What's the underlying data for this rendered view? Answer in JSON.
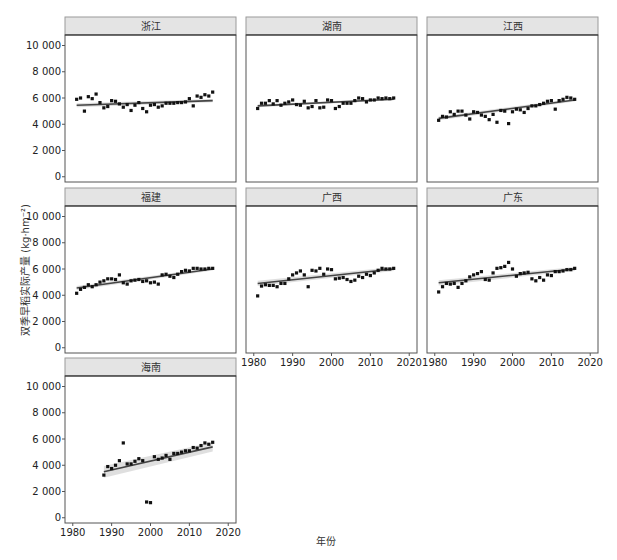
{
  "chart_data": {
    "type": "scatter",
    "layout": "facet_wrap",
    "facet_columns": 3,
    "xlabel": "年份",
    "ylabel": "双季早稻实际产量 (kg·hm⁻²)",
    "xlim": [
      1978,
      2022
    ],
    "ylim": [
      -400,
      10800
    ],
    "x_ticks": [
      1980,
      1990,
      2000,
      2010,
      2020
    ],
    "y_ticks": [
      0,
      2000,
      4000,
      6000,
      8000,
      10000
    ],
    "y_tick_labels": [
      "0",
      "2 000",
      "4 000",
      "6 000",
      "8 000",
      "10 000"
    ],
    "grid": false,
    "legend": "none",
    "colors": {
      "points": "#111111",
      "trend": "#444444",
      "band": "#d9d9d9",
      "strip": "#e4e4e4",
      "frame": "#555555"
    },
    "panels": [
      {
        "name": "浙江",
        "x": [
          1981,
          1982,
          1983,
          1984,
          1985,
          1986,
          1987,
          1988,
          1989,
          1990,
          1991,
          1992,
          1993,
          1994,
          1995,
          1996,
          1997,
          1998,
          1999,
          2000,
          2001,
          2002,
          2003,
          2004,
          2005,
          2006,
          2007,
          2008,
          2009,
          2010,
          2011,
          2012,
          2013,
          2014,
          2015,
          2016
        ],
        "y": [
          5900,
          6000,
          5000,
          6100,
          5950,
          6300,
          5650,
          5250,
          5350,
          5800,
          5750,
          5550,
          5300,
          5500,
          5050,
          5450,
          5650,
          5200,
          4950,
          5450,
          5500,
          5300,
          5400,
          5600,
          5600,
          5600,
          5650,
          5650,
          5700,
          5950,
          5400,
          6150,
          6050,
          6250,
          6150,
          6450
        ],
        "trend": {
          "x0": 1981,
          "y0": 5450,
          "x1": 2016,
          "y1": 5800,
          "band": 150
        }
      },
      {
        "name": "湖南",
        "x": [
          1981,
          1982,
          1983,
          1984,
          1985,
          1986,
          1987,
          1988,
          1989,
          1990,
          1991,
          1992,
          1993,
          1994,
          1995,
          1996,
          1997,
          1998,
          1999,
          2000,
          2001,
          2002,
          2003,
          2004,
          2005,
          2006,
          2007,
          2008,
          2009,
          2010,
          2011,
          2012,
          2013,
          2014,
          2015,
          2016
        ],
        "y": [
          5200,
          5600,
          5600,
          5800,
          5550,
          5800,
          5450,
          5600,
          5700,
          5850,
          5500,
          5450,
          5750,
          5250,
          5350,
          5800,
          5250,
          5300,
          5850,
          5800,
          5200,
          5350,
          5600,
          5600,
          5600,
          5800,
          6000,
          5950,
          5700,
          5850,
          5850,
          6000,
          5950,
          6000,
          5950,
          6000
        ],
        "trend": {
          "x0": 1981,
          "y0": 5400,
          "x1": 2016,
          "y1": 5900,
          "band": 100
        }
      },
      {
        "name": "江西",
        "x": [
          1981,
          1982,
          1983,
          1984,
          1985,
          1986,
          1987,
          1988,
          1989,
          1990,
          1991,
          1992,
          1993,
          1994,
          1995,
          1996,
          1997,
          1998,
          1999,
          2000,
          2001,
          2002,
          2003,
          2004,
          2005,
          2006,
          2007,
          2008,
          2009,
          2010,
          2011,
          2012,
          2013,
          2014,
          2015,
          2016
        ],
        "y": [
          4300,
          4600,
          4550,
          4950,
          4750,
          5000,
          5000,
          4700,
          4400,
          4950,
          4900,
          4700,
          4600,
          4350,
          4750,
          4150,
          5050,
          5000,
          4050,
          4950,
          5150,
          5100,
          4900,
          5200,
          5400,
          5400,
          5500,
          5600,
          5750,
          5800,
          5150,
          5800,
          5900,
          6050,
          6000,
          5900
        ],
        "trend": {
          "x0": 1981,
          "y0": 4450,
          "x1": 2016,
          "y1": 5850,
          "band": 150
        }
      },
      {
        "name": "福建",
        "x": [
          1981,
          1982,
          1983,
          1984,
          1985,
          1986,
          1987,
          1988,
          1989,
          1990,
          1991,
          1992,
          1993,
          1994,
          1995,
          1996,
          1997,
          1998,
          1999,
          2000,
          2001,
          2002,
          2003,
          2004,
          2005,
          2006,
          2007,
          2008,
          2009,
          2010,
          2011,
          2012,
          2013,
          2014,
          2015,
          2016
        ],
        "y": [
          4150,
          4450,
          4600,
          4800,
          4650,
          4800,
          5000,
          5100,
          5250,
          5250,
          5200,
          5550,
          4950,
          4850,
          5100,
          5150,
          5200,
          5050,
          5100,
          4950,
          5000,
          4850,
          5550,
          5600,
          5450,
          5350,
          5600,
          5800,
          5900,
          5850,
          6050,
          6050,
          6000,
          6000,
          6050,
          6050
        ],
        "trend": {
          "x0": 1981,
          "y0": 4550,
          "x1": 2016,
          "y1": 6000,
          "band": 150
        }
      },
      {
        "name": "广西",
        "x": [
          1981,
          1982,
          1983,
          1984,
          1985,
          1986,
          1987,
          1988,
          1989,
          1990,
          1991,
          1992,
          1993,
          1994,
          1995,
          1996,
          1997,
          1998,
          1999,
          2000,
          2001,
          2002,
          2003,
          2004,
          2005,
          2006,
          2007,
          2008,
          2009,
          2010,
          2011,
          2012,
          2013,
          2014,
          2015,
          2016
        ],
        "y": [
          3950,
          4700,
          4800,
          4750,
          4750,
          4650,
          4900,
          4900,
          5250,
          5550,
          5700,
          5850,
          5550,
          4650,
          5900,
          5850,
          6050,
          5600,
          6000,
          5950,
          5250,
          5300,
          5350,
          5200,
          5050,
          5150,
          5450,
          5350,
          5600,
          5500,
          5700,
          5900,
          6050,
          6000,
          6000,
          6050
        ],
        "trend": {
          "x0": 1981,
          "y0": 4900,
          "x1": 2016,
          "y1": 6000,
          "band": 200
        }
      },
      {
        "name": "广东",
        "x": [
          1981,
          1982,
          1983,
          1984,
          1985,
          1986,
          1987,
          1988,
          1989,
          1990,
          1991,
          1992,
          1993,
          1994,
          1995,
          1996,
          1997,
          1998,
          1999,
          2000,
          2001,
          2002,
          2003,
          2004,
          2005,
          2006,
          2007,
          2008,
          2009,
          2010,
          2011,
          2012,
          2013,
          2014,
          2015,
          2016
        ],
        "y": [
          4250,
          4650,
          4900,
          4850,
          4900,
          4600,
          4900,
          5100,
          5400,
          5550,
          5650,
          5800,
          5200,
          5150,
          5700,
          6050,
          6100,
          6200,
          6500,
          6000,
          5450,
          5650,
          5700,
          5750,
          5250,
          5100,
          5350,
          5150,
          5550,
          5500,
          5800,
          5800,
          5850,
          5950,
          5950,
          6050
        ],
        "trend": {
          "x0": 1981,
          "y0": 4950,
          "x1": 2016,
          "y1": 6000,
          "band": 200
        }
      },
      {
        "name": "海南",
        "x": [
          1988,
          1989,
          1990,
          1991,
          1992,
          1993,
          1994,
          1995,
          1996,
          1997,
          1998,
          1999,
          2000,
          2001,
          2002,
          2003,
          2004,
          2005,
          2006,
          2007,
          2008,
          2009,
          2010,
          2011,
          2012,
          2013,
          2014,
          2015,
          2016
        ],
        "y": [
          3250,
          3900,
          3750,
          4000,
          4350,
          5700,
          4100,
          4100,
          4300,
          4500,
          4350,
          1200,
          1150,
          4650,
          4450,
          4550,
          4750,
          4450,
          4900,
          4900,
          5000,
          5100,
          5100,
          5350,
          5300,
          5500,
          5700,
          5600,
          5750
        ],
        "trend": {
          "x0": 1988,
          "y0": 3500,
          "x1": 2016,
          "y1": 5400,
          "band": 450
        }
      }
    ]
  }
}
